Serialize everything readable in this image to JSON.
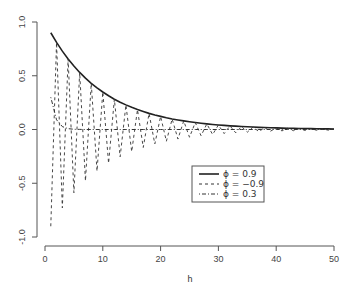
{
  "chart_data": {
    "type": "line",
    "title": "",
    "xlabel": "h",
    "ylabel": "",
    "xlim": [
      0,
      50
    ],
    "ylim": [
      -1.0,
      1.0
    ],
    "grid": false,
    "legend_position": "center-right (inside plot)",
    "x_ticks": [
      0,
      10,
      20,
      30,
      40,
      50
    ],
    "x_tick_labels": [
      "0",
      "10",
      "20",
      "30",
      "40",
      "50"
    ],
    "y_ticks": [
      1.0,
      0.5,
      0.0,
      -0.5,
      -1.0
    ],
    "y_tick_labels": [
      "1.0",
      "0.5",
      "0.0",
      "-0.5",
      "-1.0"
    ],
    "x": [
      1,
      2,
      3,
      4,
      5,
      6,
      7,
      8,
      9,
      10,
      11,
      12,
      13,
      14,
      15,
      16,
      17,
      18,
      19,
      20,
      21,
      22,
      23,
      24,
      25,
      26,
      27,
      28,
      29,
      30,
      31,
      32,
      33,
      34,
      35,
      36,
      37,
      38,
      39,
      40,
      41,
      42,
      43,
      44,
      45,
      46,
      47,
      48,
      49,
      50
    ],
    "series": [
      {
        "name": "ϕ = 0.9",
        "phi": 0.9,
        "line_style": "solid",
        "color": "#222222",
        "values": [
          0.9,
          0.81,
          0.729,
          0.656,
          0.59,
          0.531,
          0.478,
          0.43,
          0.387,
          0.349,
          0.314,
          0.282,
          0.254,
          0.229,
          0.206,
          0.185,
          0.167,
          0.15,
          0.135,
          0.122,
          0.109,
          0.098,
          0.089,
          0.08,
          0.072,
          0.065,
          0.058,
          0.052,
          0.047,
          0.042,
          0.038,
          0.034,
          0.031,
          0.028,
          0.025,
          0.023,
          0.02,
          0.018,
          0.016,
          0.015,
          0.013,
          0.012,
          0.011,
          0.01,
          0.009,
          0.008,
          0.007,
          0.006,
          0.006,
          0.005
        ]
      },
      {
        "name": "ϕ = −0.9",
        "phi": -0.9,
        "line_style": "dashed",
        "color": "#333333",
        "values": [
          -0.9,
          0.81,
          -0.729,
          0.656,
          -0.59,
          0.531,
          -0.478,
          0.43,
          -0.387,
          0.349,
          -0.314,
          0.282,
          -0.254,
          0.229,
          -0.206,
          0.185,
          -0.167,
          0.15,
          -0.135,
          0.122,
          -0.109,
          0.098,
          -0.089,
          0.08,
          -0.072,
          0.065,
          -0.058,
          0.052,
          -0.047,
          0.042,
          -0.038,
          0.034,
          -0.031,
          0.028,
          -0.025,
          0.023,
          -0.02,
          0.018,
          -0.016,
          0.015,
          -0.013,
          0.012,
          -0.011,
          0.01,
          -0.009,
          0.008,
          -0.007,
          0.006,
          -0.006,
          0.005
        ]
      },
      {
        "name": "ϕ = 0.3",
        "phi": 0.3,
        "line_style": "dotdash",
        "color": "#333333",
        "values": [
          0.3,
          0.09,
          0.027,
          0.008,
          0.002,
          0.001,
          0,
          0,
          0,
          0,
          0,
          0,
          0,
          0,
          0,
          0,
          0,
          0,
          0,
          0,
          0,
          0,
          0,
          0,
          0,
          0,
          0,
          0,
          0,
          0,
          0,
          0,
          0,
          0,
          0,
          0,
          0,
          0,
          0,
          0,
          0,
          0,
          0,
          0,
          0,
          0,
          0,
          0,
          0,
          0
        ]
      }
    ]
  },
  "legend": {
    "entries": [
      {
        "label": "ϕ = 0.9"
      },
      {
        "label": "ϕ = −0.9"
      },
      {
        "label": "ϕ = 0.3"
      }
    ]
  },
  "axes": {
    "xlabel": "h"
  }
}
